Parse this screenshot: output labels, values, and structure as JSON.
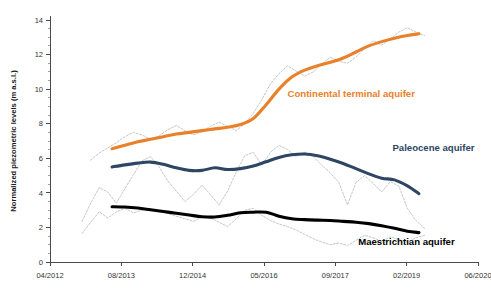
{
  "chart_data": {
    "type": "line",
    "title": "",
    "xlabel": "",
    "ylabel": "Normalized piezometric levels (m a.s.l.)",
    "ylim": [
      0,
      14
    ],
    "ytick_labels": [
      "0",
      "2",
      "4",
      "6",
      "8",
      "10",
      "12",
      "14"
    ],
    "ytick_values": [
      0,
      2,
      4,
      6,
      8,
      10,
      12,
      14
    ],
    "y_minor_step": 0.5,
    "xlim": [
      "04/2012",
      "06/2020"
    ],
    "xtick_labels": [
      "04/2012",
      "08/2013",
      "12/2014",
      "05/2016",
      "09/2017",
      "02/2019",
      "06/2020"
    ],
    "xtick_fractions": [
      0.0,
      0.1667,
      0.3333,
      0.5,
      0.6667,
      0.8333,
      1.0
    ],
    "grid": false,
    "legend_position": "inline-annotations",
    "raw_series_style": "thin grey dotted",
    "series": [
      {
        "name": "Continental terminal aquifer",
        "color": "#e8812a",
        "label_x_fraction": 0.555,
        "label_y_value": 9.55,
        "trend": {
          "x": [
            0.145,
            0.175,
            0.205,
            0.235,
            0.265,
            0.295,
            0.325,
            0.355,
            0.385,
            0.415,
            0.445,
            0.475,
            0.505,
            0.535,
            0.565,
            0.595,
            0.625,
            0.655,
            0.685,
            0.715,
            0.745,
            0.775,
            0.805,
            0.835,
            0.862
          ],
          "y": [
            6.55,
            6.75,
            6.95,
            7.1,
            7.25,
            7.4,
            7.5,
            7.6,
            7.7,
            7.8,
            7.95,
            8.3,
            9.1,
            10.0,
            10.7,
            11.1,
            11.35,
            11.55,
            11.8,
            12.15,
            12.5,
            12.75,
            12.95,
            13.1,
            13.2
          ]
        },
        "raw": {
          "x": [
            0.095,
            0.115,
            0.135,
            0.155,
            0.175,
            0.195,
            0.215,
            0.235,
            0.255,
            0.275,
            0.295,
            0.315,
            0.335,
            0.355,
            0.375,
            0.395,
            0.415,
            0.435,
            0.455,
            0.475,
            0.495,
            0.515,
            0.535,
            0.555,
            0.575,
            0.595,
            0.615,
            0.635,
            0.655,
            0.675,
            0.695,
            0.715,
            0.735,
            0.755,
            0.775,
            0.795,
            0.815,
            0.835,
            0.855,
            0.875
          ],
          "y": [
            5.9,
            6.3,
            6.6,
            6.9,
            7.25,
            7.5,
            7.35,
            7.1,
            7.3,
            7.65,
            7.9,
            7.6,
            7.35,
            7.55,
            7.85,
            8.1,
            7.85,
            7.6,
            8.0,
            8.6,
            9.4,
            10.3,
            10.9,
            11.35,
            11.05,
            10.75,
            11.0,
            11.45,
            11.85,
            11.6,
            11.5,
            11.85,
            12.35,
            12.8,
            12.55,
            12.9,
            13.3,
            13.55,
            13.3,
            13.1
          ]
        }
      },
      {
        "name": "Paleocene aquifer",
        "color": "#2e4664",
        "label_x_fraction": 0.8,
        "label_y_value": 6.45,
        "trend": {
          "x": [
            0.145,
            0.175,
            0.205,
            0.235,
            0.265,
            0.295,
            0.325,
            0.355,
            0.385,
            0.415,
            0.445,
            0.475,
            0.505,
            0.535,
            0.565,
            0.595,
            0.625,
            0.655,
            0.685,
            0.715,
            0.745,
            0.775,
            0.805,
            0.835,
            0.862
          ],
          "y": [
            5.5,
            5.62,
            5.72,
            5.78,
            5.65,
            5.45,
            5.3,
            5.3,
            5.45,
            5.35,
            5.4,
            5.55,
            5.8,
            6.05,
            6.2,
            6.25,
            6.15,
            5.95,
            5.7,
            5.4,
            5.1,
            4.85,
            4.75,
            4.4,
            3.95
          ]
        },
        "raw": {
          "x": [
            0.075,
            0.095,
            0.115,
            0.135,
            0.155,
            0.175,
            0.195,
            0.215,
            0.235,
            0.255,
            0.275,
            0.295,
            0.315,
            0.335,
            0.355,
            0.375,
            0.395,
            0.415,
            0.435,
            0.455,
            0.475,
            0.495,
            0.515,
            0.535,
            0.555,
            0.575,
            0.595,
            0.615,
            0.635,
            0.655,
            0.675,
            0.695,
            0.715,
            0.735,
            0.755,
            0.775,
            0.795,
            0.815,
            0.835,
            0.855,
            0.875
          ],
          "y": [
            2.35,
            3.4,
            4.3,
            4.05,
            3.4,
            4.25,
            5.05,
            5.85,
            6.1,
            5.5,
            4.7,
            4.1,
            3.5,
            3.9,
            4.45,
            3.9,
            3.3,
            4.1,
            5.2,
            6.15,
            6.35,
            5.6,
            6.35,
            6.75,
            6.5,
            6.1,
            6.35,
            6.1,
            5.6,
            5.15,
            4.6,
            3.3,
            4.6,
            5.0,
            4.55,
            4.05,
            4.65,
            4.4,
            3.1,
            2.4,
            1.95
          ]
        }
      },
      {
        "name": "Maestrichtian aquifer",
        "color": "#000000",
        "label_x_fraction": 0.72,
        "label_y_value": 1.0,
        "trend": {
          "x": [
            0.145,
            0.175,
            0.205,
            0.235,
            0.265,
            0.295,
            0.325,
            0.355,
            0.385,
            0.415,
            0.445,
            0.475,
            0.505,
            0.535,
            0.565,
            0.595,
            0.625,
            0.655,
            0.685,
            0.715,
            0.745,
            0.775,
            0.805,
            0.835,
            0.862
          ],
          "y": [
            3.2,
            3.18,
            3.12,
            3.02,
            2.92,
            2.82,
            2.72,
            2.62,
            2.6,
            2.7,
            2.85,
            2.88,
            2.88,
            2.65,
            2.5,
            2.45,
            2.42,
            2.4,
            2.35,
            2.3,
            2.22,
            2.1,
            1.95,
            1.78,
            1.7
          ]
        },
        "raw": {
          "x": [
            0.075,
            0.095,
            0.115,
            0.135,
            0.155,
            0.175,
            0.195,
            0.215,
            0.235,
            0.255,
            0.275,
            0.295,
            0.315,
            0.335,
            0.355,
            0.375,
            0.395,
            0.415,
            0.435,
            0.455,
            0.475,
            0.495,
            0.515,
            0.535,
            0.555,
            0.575,
            0.595,
            0.615,
            0.635,
            0.655,
            0.675,
            0.695,
            0.715,
            0.735,
            0.755,
            0.775,
            0.795,
            0.815,
            0.835,
            0.855,
            0.875
          ],
          "y": [
            1.65,
            2.3,
            2.9,
            2.55,
            2.9,
            3.1,
            2.85,
            3.0,
            3.05,
            2.95,
            2.8,
            2.65,
            2.5,
            2.35,
            2.6,
            2.55,
            2.3,
            2.05,
            2.5,
            3.0,
            3.1,
            2.7,
            2.4,
            2.2,
            2.05,
            1.85,
            1.6,
            1.35,
            1.15,
            1.0,
            1.1,
            0.95,
            1.25,
            1.55,
            1.4,
            1.2,
            1.45,
            1.3,
            1.15,
            1.4,
            1.55
          ]
        }
      }
    ]
  }
}
